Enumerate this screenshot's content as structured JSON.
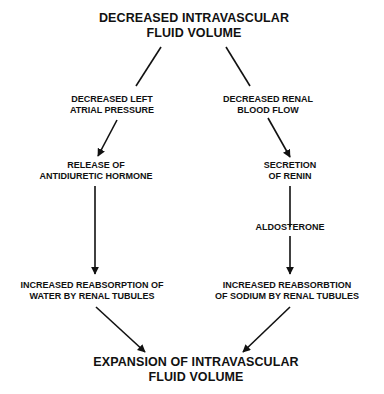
{
  "diagram": {
    "type": "flowchart",
    "nodes": {
      "top": {
        "lines": [
          "DECREASED INTRAVASCULAR",
          "FLUID VOLUME"
        ]
      },
      "left1": {
        "lines": [
          "DECREASED LEFT",
          "ATRIAL PRESSURE"
        ]
      },
      "right1": {
        "lines": [
          "DECREASED RENAL",
          "BLOOD FLOW"
        ]
      },
      "left2": {
        "lines": [
          "RELEASE OF",
          "ANTIDIURETIC HORMONE"
        ]
      },
      "right2": {
        "lines": [
          "SECRETION",
          "OF RENIN"
        ]
      },
      "right3": {
        "lines": [
          "ALDOSTERONE"
        ]
      },
      "left3": {
        "lines": [
          "INCREASED REABSORPTION OF",
          "WATER BY RENAL TUBULES"
        ]
      },
      "right4": {
        "lines": [
          "INCREASED REABSORBTION",
          "OF SODIUM BY RENAL TUBULES"
        ]
      },
      "bottom": {
        "lines": [
          "EXPANSION OF INTRAVASCULAR",
          "FLUID VOLUME"
        ]
      }
    },
    "edges": [
      {
        "from": "top",
        "to": "left1",
        "arrowhead": false
      },
      {
        "from": "top",
        "to": "right1",
        "arrowhead": false
      },
      {
        "from": "left1",
        "to": "left2",
        "arrowhead": true
      },
      {
        "from": "right1",
        "to": "right2",
        "arrowhead": true
      },
      {
        "from": "left2",
        "to": "left3",
        "arrowhead": true
      },
      {
        "from": "right2",
        "to": "right3",
        "arrowhead": false
      },
      {
        "from": "right3",
        "to": "right4",
        "arrowhead": true
      },
      {
        "from": "left3",
        "to": "bottom",
        "arrowhead": true
      },
      {
        "from": "right4",
        "to": "bottom",
        "arrowhead": true
      }
    ],
    "colors": {
      "text": "#111111",
      "background": "#ffffff"
    }
  }
}
